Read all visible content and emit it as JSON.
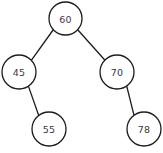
{
  "diagram": {
    "type": "binary-search-tree",
    "background_color": "#ffffff",
    "node_stroke_color": "#1c1c1c",
    "node_fill_color": "#ffffff",
    "edge_color": "#1c1c1c",
    "label_color": "#3a3a3a",
    "nodes": [
      {
        "id": "root",
        "label": "60",
        "cx": 65.5,
        "cy": 18.5,
        "r": 16.5
      },
      {
        "id": "left",
        "label": "45",
        "cx": 19.0,
        "cy": 72.0,
        "r": 17.0
      },
      {
        "id": "right",
        "label": "70",
        "cx": 117.0,
        "cy": 72.0,
        "r": 17.0
      },
      {
        "id": "left-right",
        "label": "55",
        "cx": 49.0,
        "cy": 129.0,
        "r": 17.0
      },
      {
        "id": "right-right",
        "label": "78",
        "cx": 144.0,
        "cy": 129.0,
        "r": 17.0
      }
    ],
    "edges": [
      {
        "id": "edge-root-left",
        "from": "60",
        "to": "45",
        "x1": 53.1,
        "y1": 30.0,
        "x2": 31.3,
        "y2": 60.3
      },
      {
        "id": "edge-root-right",
        "from": "60",
        "to": "70",
        "x1": 77.5,
        "y1": 29.5,
        "x2": 105.2,
        "y2": 60.5
      },
      {
        "id": "edge-left-leftright",
        "from": "45",
        "to": "55",
        "x1": 28.5,
        "y1": 86.4,
        "x2": 38.9,
        "y2": 116.0
      },
      {
        "id": "edge-right-rightright",
        "from": "70",
        "to": "78",
        "x1": 126.7,
        "y1": 86.0,
        "x2": 134.2,
        "y2": 116.1
      }
    ]
  }
}
